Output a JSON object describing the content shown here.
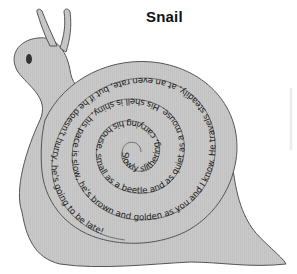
{
  "title": "Snail",
  "poem": {
    "full_text": "Slowly slithering, carrying his house, small as a beetle and as quiet as a mouse. His shell is shiny, his pace is slow, he's brown and golden as you and I know. He travels steadily, at an even rate, but if he doesn't hurry, he's going to be late!",
    "spiral_text": "Slowly slithering, carrying his house, small as a beetle and as quiet as a mouse. His shell is shiny, his pace is slow, he's brown and golden as you and I know. He travels steadily, at an even rate, but if he doesn't hurry, he's going to be late!",
    "lines": [
      "Slowly slithering, carrying his house,",
      "small as a beetle and as quiet as a mouse.",
      "His shell is shiny, his pace is slow,",
      "he's brown and golden as you and I know.",
      "He travels steadily, at an even rate,",
      "but if he doesn't hurry, he's going to be late!"
    ]
  },
  "illustration": {
    "subject": "snail",
    "body_color": "#c8c8c8",
    "shell_color": "#cfcfcf",
    "outline_color": "#555555",
    "eye_color": "#333333"
  }
}
